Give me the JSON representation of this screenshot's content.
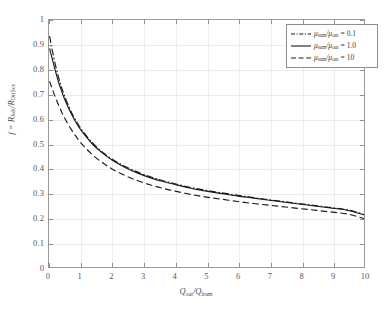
{
  "figure": {
    "background_color": "#ffffff",
    "axes_color": "#9a9a9a",
    "grid_color": "#ececec",
    "curve_color": "#1a1a1a"
  },
  "axis": {
    "xlabel_main": "Q",
    "xlabel_sub1": "out",
    "xlabel_slash": "/Q",
    "xlabel_sub2": "frum",
    "ylabel_prefix": "f = R",
    "ylabel_sub1": "JoK",
    "ylabel_slash": "/R",
    "ylabel_sub2": "Orifice",
    "xticks": [
      "0",
      "1",
      "2",
      "3",
      "4",
      "5",
      "6",
      "7",
      "8",
      "9",
      "10"
    ],
    "yticks": [
      "0",
      "0.1",
      "0.2",
      "0.3",
      "0.4",
      "0.5",
      "0.6",
      "0.7",
      "0.8",
      "0.9",
      "1"
    ]
  },
  "legend": {
    "position": "top-right",
    "entries": [
      {
        "style": "dashdot",
        "mu_symbol": "μ",
        "num_sub": "sum",
        "slash": "/",
        "den_sub": "out",
        "equals": " = ",
        "value": "0.1",
        "label": "μ_sum/μ_out = 0.1"
      },
      {
        "style": "solid",
        "mu_symbol": "μ",
        "num_sub": "sum",
        "slash": "/",
        "den_sub": "out",
        "equals": " = ",
        "value": "1.0",
        "label": "μ_sum/μ_out = 1.0"
      },
      {
        "style": "dashed",
        "mu_symbol": "μ",
        "num_sub": "sum",
        "slash": "/",
        "den_sub": "out",
        "equals": " = ",
        "value": "10",
        "label": "μ_sum/μ_out = 10"
      }
    ]
  },
  "chart_data": {
    "type": "line",
    "title": "",
    "xlabel": "Q_out/Q_frum",
    "ylabel": "f = R_JoK/R_Orifice",
    "xlim": [
      0,
      10
    ],
    "ylim": [
      0,
      1
    ],
    "grid": true,
    "legend_position": "top-right",
    "x": [
      0.02,
      0.05,
      0.1,
      0.2,
      0.3,
      0.4,
      0.5,
      0.7,
      0.9,
      1.1,
      1.4,
      1.7,
      2.0,
      2.4,
      2.8,
      3.2,
      3.6,
      4.0,
      4.5,
      5.0,
      5.5,
      6.0,
      6.5,
      7.0,
      7.5,
      8.0,
      8.5,
      9.0,
      9.5,
      10.0
    ],
    "series": [
      {
        "name": "μ_sum/μ_out = 0.1",
        "style": "dashdot",
        "values": [
          0.935,
          0.912,
          0.88,
          0.82,
          0.77,
          0.727,
          0.69,
          0.63,
          0.583,
          0.545,
          0.5,
          0.465,
          0.437,
          0.408,
          0.385,
          0.366,
          0.35,
          0.337,
          0.322,
          0.31,
          0.3,
          0.29,
          0.281,
          0.272,
          0.264,
          0.256,
          0.248,
          0.24,
          0.231,
          0.213
        ]
      },
      {
        "name": "μ_sum/μ_out = 1.0",
        "style": "solid",
        "values": [
          0.885,
          0.868,
          0.845,
          0.795,
          0.75,
          0.712,
          0.678,
          0.622,
          0.576,
          0.54,
          0.495,
          0.461,
          0.433,
          0.404,
          0.381,
          0.362,
          0.347,
          0.334,
          0.319,
          0.307,
          0.297,
          0.287,
          0.279,
          0.27,
          0.262,
          0.254,
          0.246,
          0.238,
          0.229,
          0.211
        ]
      },
      {
        "name": "μ_sum/μ_out = 10",
        "style": "dashed",
        "values": [
          0.752,
          0.74,
          0.722,
          0.688,
          0.657,
          0.628,
          0.602,
          0.558,
          0.521,
          0.49,
          0.452,
          0.422,
          0.397,
          0.371,
          0.35,
          0.333,
          0.319,
          0.307,
          0.294,
          0.283,
          0.274,
          0.265,
          0.257,
          0.25,
          0.243,
          0.236,
          0.229,
          0.222,
          0.214,
          0.196
        ]
      }
    ]
  }
}
